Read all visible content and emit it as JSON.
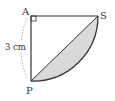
{
  "diagram": {
    "points": {
      "A": {
        "label": "A",
        "x": 31,
        "y": 16
      },
      "S": {
        "label": "S",
        "x": 98,
        "y": 16
      },
      "P": {
        "label": "P",
        "x": 31,
        "y": 81
      }
    },
    "radius_label": "3 cm",
    "colors": {
      "stroke": "#333333",
      "shade": "#d9d9d9",
      "dashed": "#999999"
    }
  }
}
